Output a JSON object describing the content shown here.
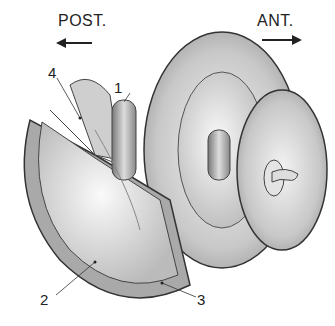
{
  "figure": {
    "orientation": {
      "posterior_label": "POST.",
      "anterior_label": "ANT."
    },
    "callouts": [
      {
        "number": "1"
      },
      {
        "number": "2"
      },
      {
        "number": "3"
      },
      {
        "number": "4"
      }
    ],
    "colors": {
      "line": "#333333",
      "shade_dark": "#8a8a8a",
      "shade_mid": "#bdbdbd",
      "shade_light": "#e6e6e6"
    }
  }
}
